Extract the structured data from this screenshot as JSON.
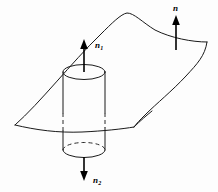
{
  "figure": {
    "background_color": "#fdfdfd",
    "line_color": "#1a1a1a",
    "labels": {
      "surface_normal": "n",
      "upper_normal_base": "n",
      "upper_normal_sub": "1",
      "lower_normal_base": "n",
      "lower_normal_sub": "2"
    },
    "elements": {
      "surface_name": "curved-surface",
      "cylinder_name": "pillbox-cylinder",
      "hidden_edges": "dashed-hidden-edges"
    },
    "geometry": {
      "canvas_width": 218,
      "canvas_height": 192,
      "cylinder_center_x": 84,
      "cylinder_top_y": 72,
      "cylinder_bottom_y": 150,
      "cylinder_rx": 21,
      "cylinder_ry": 7.5,
      "surface_left_x": 15,
      "surface_peak_x": 127,
      "surface_peak_y": 14,
      "surface_right_x": 207
    },
    "arrows": {
      "n": {
        "x": 176,
        "tail_y": 50,
        "tip_y": 17
      },
      "n1": {
        "x": 84,
        "tail_y": 72,
        "tip_y": 40
      },
      "n2": {
        "x": 84,
        "tail_y": 157,
        "tip_y": 181
      }
    }
  }
}
